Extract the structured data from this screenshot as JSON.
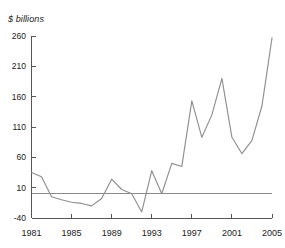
{
  "chart_data": {
    "type": "line",
    "title": "",
    "subtitle": "",
    "xlabel": "",
    "ylabel": "$ billions",
    "unit_label": "$ billions",
    "xlim": [
      1981,
      2005
    ],
    "ylim": [
      -40,
      260
    ],
    "grid": false,
    "legend": false,
    "legend_position": "none",
    "zero_reference_line": 0,
    "ytick_labels": [
      "260",
      "210",
      "160",
      "110",
      "60",
      "10",
      "-40"
    ],
    "yticks": [
      260,
      210,
      160,
      110,
      60,
      10,
      -40
    ],
    "xtick_labels": [
      "1981",
      "1985",
      "1989",
      "1993",
      "1997",
      "2001",
      "2005"
    ],
    "xticks": [
      1981,
      1985,
      1989,
      1993,
      1997,
      2001,
      2005
    ],
    "x": [
      1981,
      1982,
      1983,
      1984,
      1985,
      1986,
      1987,
      1988,
      1989,
      1990,
      1991,
      1992,
      1993,
      1994,
      1995,
      1996,
      1997,
      1998,
      1999,
      2000,
      2001,
      2002,
      2003,
      2004,
      2005
    ],
    "series": [
      {
        "name": "Net flows",
        "color": "#8f8f8f",
        "values": [
          35,
          28,
          -5,
          -10,
          -14,
          -16,
          -20,
          -8,
          24,
          7,
          0,
          -30,
          38,
          0,
          50,
          45,
          153,
          93,
          130,
          190,
          93,
          66,
          88,
          145,
          257
        ]
      }
    ],
    "categories": [
      "1981",
      "1982",
      "1983",
      "1984",
      "1985",
      "1986",
      "1987",
      "1988",
      "1989",
      "1990",
      "1991",
      "1992",
      "1993",
      "1994",
      "1995",
      "1996",
      "1997",
      "1998",
      "1999",
      "2000",
      "2001",
      "2002",
      "2003",
      "2004",
      "2005"
    ],
    "values": [
      35,
      28,
      -5,
      -10,
      -14,
      -16,
      -20,
      -8,
      24,
      7,
      0,
      -30,
      38,
      0,
      50,
      45,
      153,
      93,
      130,
      190,
      93,
      66,
      88,
      145,
      257
    ]
  },
  "colors": {
    "series": "#8f8f8f",
    "axis": "#555555",
    "zero_line": "#8a8a8a",
    "text": "#1a1a1a",
    "background": "#ffffff"
  }
}
